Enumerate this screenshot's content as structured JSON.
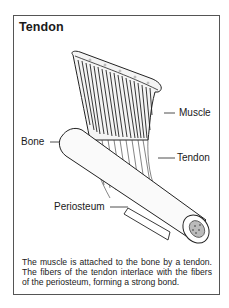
{
  "figure": {
    "title": "Tendon",
    "labels": {
      "muscle": "Muscle",
      "bone": "Bone",
      "tendon": "Tendon",
      "periosteum": "Periosteum"
    },
    "caption": "The muscle is attached to the bone by a tendon. The fibers of the tendon interlace with the fibers of the periosteum, forming a strong bond."
  }
}
